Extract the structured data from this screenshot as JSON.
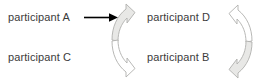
{
  "diagram": {
    "background_color": "#ffffff",
    "text_color": "#3b3b3b",
    "arrow_color": "#000000",
    "curve_fill_color": "#e8e8e6",
    "curve_stroke_color": "#b0b0ae",
    "labels": [
      {
        "id": "a",
        "text": "participant A",
        "position": "top-left"
      },
      {
        "id": "c",
        "text": "participant C",
        "position": "bottom-left"
      },
      {
        "id": "d",
        "text": "participant D",
        "position": "top-right"
      },
      {
        "id": "b",
        "text": "participant B",
        "position": "bottom-right"
      }
    ],
    "connectors": [
      {
        "id": "straight-arrow",
        "icon": "right-arrow-icon",
        "style": "solid-black",
        "from": "participant A",
        "direction": "right"
      },
      {
        "id": "center-rotation",
        "icon": "curved-double-arrow-icon",
        "style": "clockwise-s-curve",
        "top_arrow_fill": "filled",
        "bottom_arrow_fill": "outline"
      },
      {
        "id": "right-rotation",
        "icon": "curved-double-arrow-icon",
        "style": "mirrored-s-curve",
        "top_arrow_fill": "outline",
        "bottom_arrow_fill": "filled"
      }
    ]
  }
}
